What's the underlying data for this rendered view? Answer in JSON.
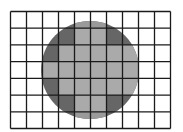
{
  "diagram": {
    "grid": {
      "columns": 10,
      "rows": 7
    },
    "colors": {
      "background": "#ffffff",
      "grid_line": "#1a1a1a",
      "partial_cell": "#666666",
      "full_cell": "#aaaaaa",
      "cap": "#9a9a9a"
    },
    "full_cells": [
      [
        1,
        4
      ],
      [
        1,
        5
      ],
      [
        2,
        3
      ],
      [
        2,
        4
      ],
      [
        2,
        5
      ],
      [
        2,
        6
      ],
      [
        2,
        7
      ],
      [
        3,
        2
      ],
      [
        3,
        3
      ],
      [
        3,
        4
      ],
      [
        3,
        5
      ],
      [
        3,
        6
      ],
      [
        3,
        7
      ],
      [
        4,
        3
      ],
      [
        4,
        4
      ],
      [
        4,
        5
      ],
      [
        4,
        6
      ],
      [
        4,
        7
      ],
      [
        5,
        4
      ],
      [
        5,
        5
      ]
    ],
    "cap_cells": [
      [
        0,
        4
      ],
      [
        0,
        5
      ],
      [
        6,
        4
      ],
      [
        6,
        5
      ]
    ]
  }
}
